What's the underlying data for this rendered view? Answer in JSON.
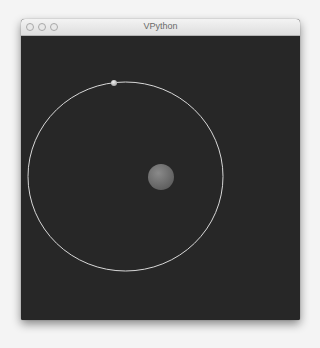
{
  "window": {
    "title": "VPython",
    "controls": [
      "close",
      "minimize",
      "zoom"
    ]
  },
  "scene": {
    "background": "#272727",
    "orbit": {
      "color": "#d8d8d8",
      "cx": 104.5,
      "cy": 140.5,
      "rx": 97.5,
      "ry": 94.5
    },
    "sun": {
      "color": "#7a7a7a",
      "cx": 140,
      "cy": 141,
      "r": 13
    },
    "planet": {
      "color": "#cfcfcf",
      "cx": 93,
      "cy": 47,
      "r": 3
    }
  }
}
